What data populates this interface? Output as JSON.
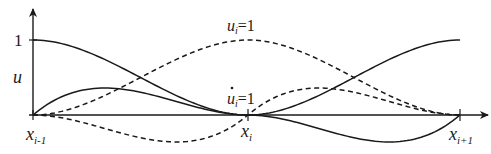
{
  "figure": {
    "type": "hermite-shape-functions",
    "axes": {
      "y_label": "u",
      "y_tick_label": "1",
      "x_ticks": [
        {
          "base": "x",
          "sub": "i-1"
        },
        {
          "base": "x",
          "sub": "i"
        },
        {
          "base": "x",
          "sub": "i+1"
        }
      ]
    },
    "annotations": [
      {
        "id": "value-dof",
        "base": "u",
        "sub": "i",
        "dot": false,
        "eq": "=1",
        "curve_style": "dashed"
      },
      {
        "id": "slope-dof",
        "base": "u",
        "sub": "i",
        "dot": true,
        "eq": "=1",
        "curve_style": "dashed"
      }
    ],
    "curves": [
      {
        "name": "N1-left-value",
        "style": "solid",
        "from": "x_{i-1}",
        "to": "x_i",
        "start": 1,
        "end": 0
      },
      {
        "name": "N2-left-slope",
        "style": "solid",
        "from": "x_{i-1}",
        "to": "x_i",
        "peak": "positive"
      },
      {
        "name": "ui-value",
        "style": "dashed",
        "from": "x_{i-1}",
        "to": "x_{i+1}",
        "peak_at": "x_i",
        "peak": 1
      },
      {
        "name": "ui-slope",
        "style": "dashed",
        "from": "x_{i-1}",
        "to": "x_{i+1}",
        "zero_at": "x_i"
      },
      {
        "name": "N1-right-value",
        "style": "solid",
        "from": "x_i",
        "to": "x_{i+1}",
        "start": 0,
        "end": 1
      },
      {
        "name": "N2-right-slope",
        "style": "solid",
        "from": "x_i",
        "to": "x_{i+1}",
        "peak": "negative"
      }
    ],
    "colors": {
      "ink": "#1a1a1a",
      "background": "#ffffff"
    }
  }
}
